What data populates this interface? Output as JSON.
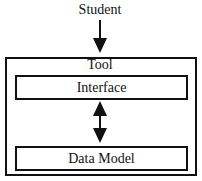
{
  "diagram": {
    "actor": {
      "label": "Student"
    },
    "container": {
      "label": "Tool"
    },
    "components": [
      {
        "label": "Interface"
      },
      {
        "label": "Data Model"
      }
    ],
    "connections": [
      {
        "from": "Student",
        "to": "Tool",
        "type": "one-way-arrow"
      },
      {
        "from": "Interface",
        "to": "Data Model",
        "type": "two-way-arrow"
      }
    ]
  }
}
